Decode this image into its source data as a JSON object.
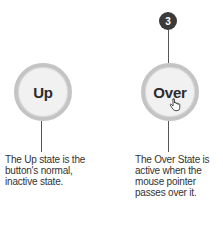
{
  "states": [
    {
      "label": "Up",
      "caption": "The Up state is the button's normal, inactive state."
    },
    {
      "label": "Over",
      "caption": "The Over State is active when the mouse pointer passes over it.",
      "badge": "3",
      "cursor_icon": "hand-pointer-icon"
    }
  ],
  "colors": {
    "circle_fill": "#f1f1f1",
    "circle_ring": "#c4c4c4",
    "badge": "#3a3a3a",
    "line": "#555555"
  }
}
